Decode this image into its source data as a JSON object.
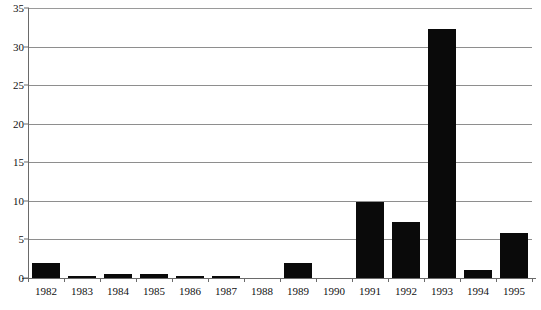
{
  "chart_data": {
    "type": "bar",
    "title": "",
    "subtitle": "",
    "xlabel": "",
    "ylabel": "",
    "categories": [
      "1982",
      "1983",
      "1984",
      "1985",
      "1986",
      "1987",
      "1988",
      "1989",
      "1990",
      "1991",
      "1992",
      "1993",
      "1994",
      "1995"
    ],
    "values": [
      2.0,
      0.2,
      0.5,
      0.5,
      0.2,
      0.2,
      0,
      2.0,
      0,
      9.9,
      7.2,
      32.3,
      1.0,
      5.8
    ],
    "ylim": [
      0,
      35
    ],
    "ytick_labels": [
      "0",
      "5",
      "10",
      "15",
      "20",
      "25",
      "30",
      "35"
    ],
    "ytick_values": [
      0,
      5,
      10,
      15,
      20,
      25,
      30,
      35
    ],
    "grid": "horizontal",
    "legend": "none",
    "bar_color": "#0a0a0a",
    "grid_color": "#8e8e8e",
    "axis_color": "#6a6a6a",
    "background_color": "#ffffff"
  }
}
